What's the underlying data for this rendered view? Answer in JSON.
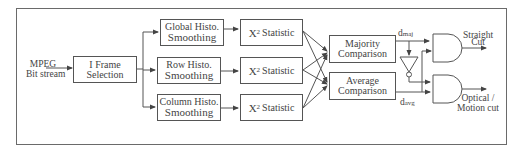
{
  "diagram": {
    "input": {
      "line1": "MPEG",
      "line2": "Bit stream"
    },
    "iframe": {
      "line1": "I Frame",
      "line2": "Selection"
    },
    "histo": [
      {
        "line1": "Global Histo.",
        "line2": "Smoothing"
      },
      {
        "line1": "Row Histo.",
        "line2": "Smoothing"
      },
      {
        "line1": "Column Histo.",
        "line2": "Smoothing"
      }
    ],
    "statistic": {
      "symbol": "X",
      "superscript": "2",
      "label": "Statistic"
    },
    "comparisons": [
      {
        "line1": "Majority",
        "line2": "Comparison"
      },
      {
        "line1": "Average",
        "line2": "Comparison"
      }
    ],
    "signals": {
      "d_maj": {
        "base": "d",
        "sub": "maj"
      },
      "d_avg": {
        "base": "d",
        "sub": "avg"
      }
    },
    "outputs": {
      "straight": {
        "line1": "Straight",
        "line2": "Cut"
      },
      "optical": {
        "line1": "Optical /",
        "line2": "Motion cut"
      }
    },
    "colors": {
      "line": "#555555",
      "frame": "#6a6a6a",
      "text": "#444444"
    }
  }
}
